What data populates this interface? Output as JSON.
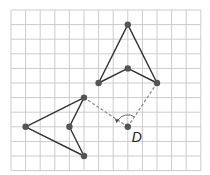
{
  "diagram": {
    "type": "rotation-on-grid",
    "grid": {
      "origin": [
        11,
        10
      ],
      "step": 14.6,
      "cols": 13,
      "rows": 11,
      "color": "#cccccc"
    },
    "center": {
      "label": "D",
      "col": 8,
      "row": 8
    },
    "shape_original": {
      "name": "rotated-arrowhead-left",
      "points": [
        [
          5,
          6
        ],
        [
          1,
          8
        ],
        [
          5,
          10
        ],
        [
          4,
          8
        ]
      ]
    },
    "shape_image": {
      "name": "arrowhead-up",
      "points": [
        [
          8,
          1
        ],
        [
          6,
          5
        ],
        [
          8,
          4
        ],
        [
          10,
          5
        ]
      ]
    },
    "dashed_lines": [
      {
        "from": [
          5,
          6
        ],
        "to": [
          8,
          8
        ]
      },
      {
        "from": [
          10,
          5
        ],
        "to": [
          8,
          8
        ]
      }
    ],
    "colors": {
      "line": "#333333",
      "point": "#555555",
      "dashed": "#888888"
    }
  },
  "labels": {
    "center": "D"
  }
}
